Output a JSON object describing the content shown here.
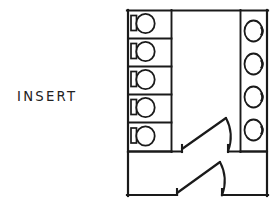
{
  "drawing": {
    "title": "Restroom Floor Plan Sketch",
    "annotation_label": "INSERT",
    "line_color": "#1a1a1a",
    "background_color": "#ffffff",
    "fixture_fill": "#ffffff"
  },
  "plan": {
    "outline": {
      "name": "building-outline",
      "left": 127,
      "top": 10,
      "right": 268,
      "bottom": 196,
      "notes": "outer wall of restroom block"
    },
    "toilet_stalls": {
      "name": "toilet-stall-bank",
      "count": 5,
      "column_left": 127,
      "column_right": 172,
      "top": 10,
      "bottom": 152,
      "stall_labels": [
        "Stall 1",
        "Stall 2",
        "Stall 3",
        "Stall 4",
        "Stall 5"
      ],
      "fixture_type": "water-closet"
    },
    "lavatories": {
      "name": "lavatory-bank",
      "count": 4,
      "column_left": 240,
      "column_right": 268,
      "top": 10,
      "bottom": 152,
      "fixture_type": "lavatory-sink",
      "labels": [
        "Sink 1",
        "Sink 2",
        "Sink 3",
        "Sink 4"
      ]
    },
    "circulation": {
      "name": "circulation-corridor",
      "left": 172,
      "right": 240,
      "top": 10,
      "bottom": 152
    },
    "vestibule": {
      "name": "entry-vestibule",
      "left": 127,
      "right": 268,
      "top": 152,
      "bottom": 196
    },
    "doors": [
      {
        "name": "interior-door",
        "hinge_x": 228,
        "hinge_y": 152,
        "leaf_end_x": 182,
        "leaf_end_y": 149,
        "swing": "left",
        "label": "Door A"
      },
      {
        "name": "entry-door",
        "hinge_x": 222,
        "hinge_y": 196,
        "leaf_end_x": 177,
        "leaf_end_y": 193,
        "swing": "left",
        "label": "Door B"
      }
    ]
  }
}
